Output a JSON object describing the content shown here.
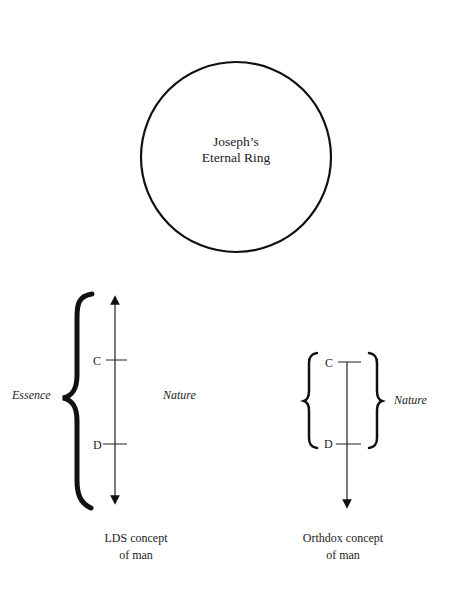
{
  "ring": {
    "line1": "Joseph’s",
    "line2": "Eternal Ring"
  },
  "lds": {
    "left_label": "Essence",
    "right_label": "Nature",
    "tick_upper": "C",
    "tick_lower": "D",
    "caption_line1": "LDS concept",
    "caption_line2": "of man",
    "arrow": "bidirectional"
  },
  "orthodox": {
    "right_label": "Nature",
    "tick_upper": "C",
    "tick_lower": "D",
    "caption_line1": "Orthdox concept",
    "caption_line2": "of man",
    "arrow": "downward"
  },
  "colors": {
    "ink": "#111111",
    "background": "#ffffff"
  }
}
